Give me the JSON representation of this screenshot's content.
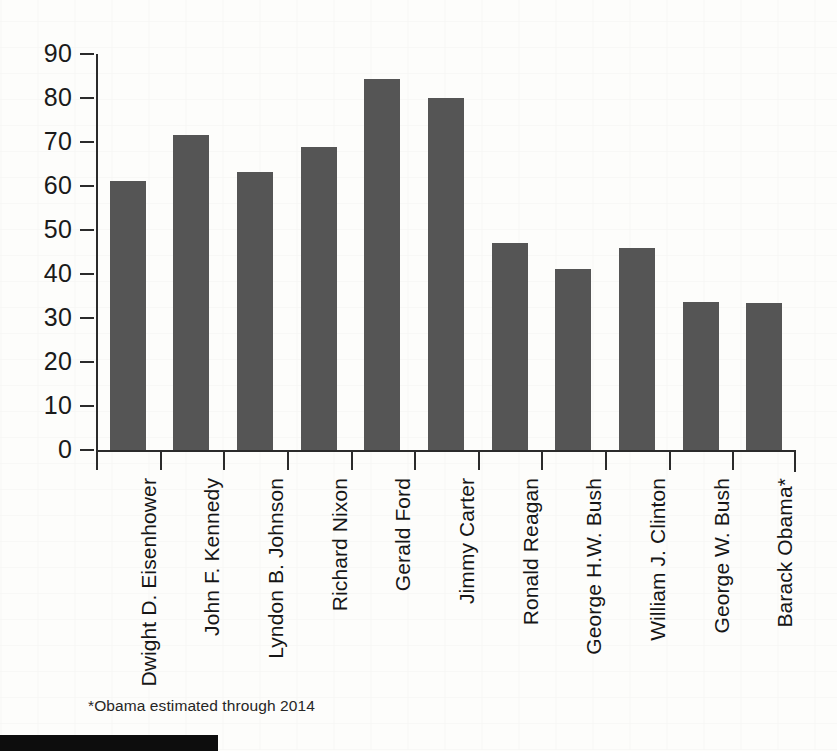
{
  "chart_data": {
    "type": "bar",
    "title": "",
    "subtitle": "",
    "xlabel": "",
    "ylabel": "",
    "ylim": [
      0,
      90
    ],
    "ytick_values": [
      90,
      80,
      70,
      60,
      50,
      40,
      30,
      20,
      10,
      0
    ],
    "ytick_labels": [
      "90",
      "80",
      "70",
      "60",
      "50",
      "40",
      "30",
      "20",
      "10",
      "0"
    ],
    "grid": false,
    "legend": false,
    "bar_color": "#555555",
    "axis_color": "#2b2b2b",
    "categories": [
      "Dwight D. Eisenhower",
      "John F. Kennedy",
      "Lyndon B. Johnson",
      "Richard Nixon",
      "Gerald Ford",
      "Jimmy Carter",
      "Ronald Reagan",
      "George H.W. Bush",
      "William J. Clinton",
      "George W. Bush",
      "Barack Obama*"
    ],
    "values": [
      61.2,
      71.6,
      63.1,
      68.9,
      84.3,
      80.1,
      47.1,
      41.2,
      45.9,
      33.6,
      33.4
    ],
    "annotations": [
      "*Obama estimated through 2014"
    ]
  },
  "footnote": {
    "text": "*Obama estimated through 2014"
  },
  "decor": {
    "bottom_bar_color": "#0d0d0d"
  }
}
